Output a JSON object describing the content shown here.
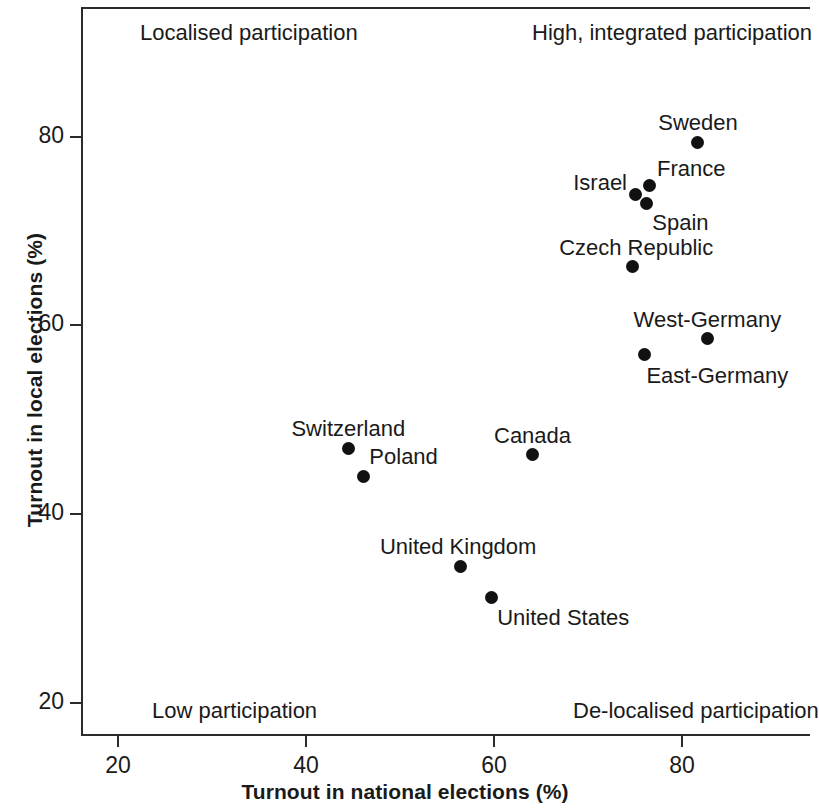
{
  "chart_data": {
    "type": "scatter",
    "title": "",
    "xlabel": "Turnout in national elections (%)",
    "ylabel": "Turnout in local elections (%)",
    "xlim": [
      14,
      91
    ],
    "ylim": [
      17.5,
      91
    ],
    "xticks": [
      20,
      40,
      60,
      80
    ],
    "yticks": [
      20,
      40,
      60,
      80
    ],
    "xtick_labels": [
      "20",
      "40",
      "60",
      "80"
    ],
    "ytick_labels": [
      "20",
      "40",
      "60",
      "80"
    ],
    "grid": false,
    "legend": "none",
    "marker_color": "#111111",
    "points": [
      {
        "label": "Sweden",
        "x": 81.7,
        "y": 79.4,
        "label_dx": 0,
        "label_dy": -14,
        "anchor": "center"
      },
      {
        "label": "France",
        "x": 76.5,
        "y": 74.8,
        "label_dx": 8,
        "label_dy": -12,
        "anchor": "start"
      },
      {
        "label": "Israel",
        "x": 75.0,
        "y": 73.9,
        "label_dx": -8,
        "label_dy": -6,
        "anchor": "end"
      },
      {
        "label": "Spain",
        "x": 76.2,
        "y": 72.9,
        "label_dx": 6,
        "label_dy": 24,
        "anchor": "start"
      },
      {
        "label": "Czech Republic",
        "x": 74.7,
        "y": 66.2,
        "label_dx": 4,
        "label_dy": -14,
        "anchor": "center"
      },
      {
        "label": "West-Germany",
        "x": 82.7,
        "y": 58.6,
        "label_dx": 0,
        "label_dy": -14,
        "anchor": "center"
      },
      {
        "label": "East-Germany",
        "x": 76.0,
        "y": 56.9,
        "label_dx": 2,
        "label_dy": 26,
        "anchor": "start"
      },
      {
        "label": "Switzerland",
        "x": 44.5,
        "y": 47.0,
        "label_dx": 0,
        "label_dy": -14,
        "anchor": "center"
      },
      {
        "label": "Poland",
        "x": 46.1,
        "y": 44.0,
        "label_dx": 6,
        "label_dy": -14,
        "anchor": "start"
      },
      {
        "label": "Canada",
        "x": 64.1,
        "y": 46.3,
        "label_dx": 0,
        "label_dy": -14,
        "anchor": "center"
      },
      {
        "label": "United Kingdom",
        "x": 56.4,
        "y": 34.5,
        "label_dx": -2,
        "label_dy": -14,
        "anchor": "center"
      },
      {
        "label": "United States",
        "x": 59.7,
        "y": 31.2,
        "label_dx": 6,
        "label_dy": 26,
        "anchor": "start"
      }
    ],
    "annotations": [
      {
        "text": "Localised participation",
        "corner": "top-left",
        "left": 140,
        "top": 20
      },
      {
        "text": "High, integrated participation",
        "corner": "top-right",
        "left": 532,
        "top": 20
      },
      {
        "text": "Low participation",
        "corner": "bottom-left",
        "left": 152,
        "top": 698
      },
      {
        "text": "De-localised participation",
        "corner": "bottom-right",
        "left": 573,
        "top": 698
      }
    ]
  }
}
